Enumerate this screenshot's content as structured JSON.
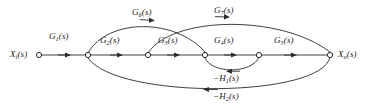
{
  "diagram": {
    "type": "signal-flow-graph",
    "stroke_color": "#2b2b2b",
    "node_fill": "#ffffff",
    "text_color": "#1a1a1a",
    "input_node": {
      "label_base": "X",
      "label_sub": "i",
      "label_arg": "(s)",
      "label_full": "Xi(s)"
    },
    "output_node": {
      "label_base": "X",
      "label_sub": "o",
      "label_arg": "(s)",
      "label_full": "Xo(s)"
    },
    "nodes": [
      {
        "id": "n1",
        "x": 39,
        "y": 55
      },
      {
        "id": "n2",
        "x": 88,
        "y": 55
      },
      {
        "id": "n3",
        "x": 148,
        "y": 55
      },
      {
        "id": "n4",
        "x": 205,
        "y": 55
      },
      {
        "id": "n5",
        "x": 259,
        "y": 55
      },
      {
        "id": "n6",
        "x": 330,
        "y": 55
      }
    ],
    "branches": [
      {
        "id": "g1",
        "from": "n1",
        "to": "n2",
        "base": "G",
        "sub": "1",
        "arg": "(s)",
        "full": "G1(s)",
        "kind": "forward"
      },
      {
        "id": "g2",
        "from": "n2",
        "to": "n3",
        "base": "G",
        "sub": "2",
        "arg": "(s)",
        "full": "G2(s)",
        "kind": "forward"
      },
      {
        "id": "g3",
        "from": "n3",
        "to": "n4",
        "base": "G",
        "sub": "3",
        "arg": "(s)",
        "full": "G3(s)",
        "kind": "forward"
      },
      {
        "id": "g4",
        "from": "n4",
        "to": "n5",
        "base": "G",
        "sub": "4",
        "arg": "(s)",
        "full": "G4(s)",
        "kind": "forward"
      },
      {
        "id": "g5",
        "from": "n5",
        "to": "n6",
        "base": "G",
        "sub": "5",
        "arg": "(s)",
        "full": "G5(s)",
        "kind": "forward"
      },
      {
        "id": "g6",
        "from": "n2",
        "to": "n4",
        "base": "G",
        "sub": "6",
        "arg": "(s)",
        "full": "G6(s)",
        "kind": "feedforward-upper"
      },
      {
        "id": "g7",
        "from": "n3",
        "to": "n6",
        "base": "G",
        "sub": "7",
        "arg": "(s)",
        "full": "G7(s)",
        "kind": "feedforward-upper"
      },
      {
        "id": "h1",
        "from": "n5",
        "to": "n4",
        "base": "−H",
        "sub": "1",
        "arg": "(s)",
        "full": "−H1(s)",
        "kind": "feedback-local"
      },
      {
        "id": "h2",
        "from": "n6",
        "to": "n2",
        "base": "−H",
        "sub": "2",
        "arg": "(s)",
        "full": "−H2(s)",
        "kind": "feedback-global"
      }
    ],
    "labels": {
      "g6_label": "G6(s)",
      "g7_label": "G7(s)",
      "g1_label": "G1(s)",
      "g2_label": "G2(s)",
      "g3_label": "G3(s)",
      "g4_label": "G4(s)",
      "g5_label": "G5(s)",
      "h1_label": "−H1(s)",
      "h2_label": "−H2(s)",
      "input_label": "Xi(s)",
      "output_label": "Xo(s)"
    }
  }
}
